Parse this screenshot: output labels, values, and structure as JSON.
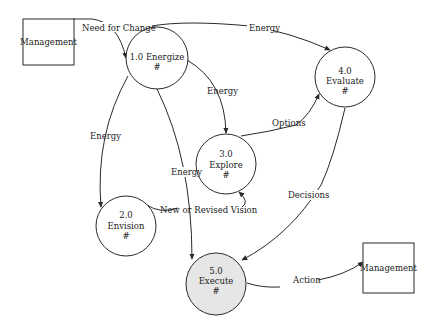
{
  "diagram": {
    "type": "data-flow-diagram",
    "colors": {
      "line": "#2a2a2a",
      "text": "#222222",
      "process_fill": "#ffffff",
      "execute_fill": "#e6e6e6",
      "background": "#ffffff"
    },
    "entities": [
      {
        "id": "mgmt_in",
        "label": "Management"
      },
      {
        "id": "mgmt_out",
        "label": "Management"
      }
    ],
    "processes": [
      {
        "id": "p1",
        "number": "1.0",
        "name": "Energize",
        "mark": "#"
      },
      {
        "id": "p2",
        "number": "2.0",
        "name": "Envision",
        "mark": "#"
      },
      {
        "id": "p3",
        "number": "3.0",
        "name": "Explore",
        "mark": "#"
      },
      {
        "id": "p4",
        "number": "4.0",
        "name": "Evaluate",
        "mark": "#"
      },
      {
        "id": "p5",
        "number": "5.0",
        "name": "Execute",
        "mark": "#"
      }
    ],
    "flows": [
      {
        "from": "Management",
        "to": "1.0 Energize",
        "label": "Need for Change"
      },
      {
        "from": "1.0 Energize",
        "to": "4.0 Evaluate",
        "label": "Energy"
      },
      {
        "from": "1.0 Energize",
        "to": "3.0 Explore",
        "label": "Energy"
      },
      {
        "from": "1.0 Energize",
        "to": "2.0 Envision",
        "label": "Energy"
      },
      {
        "from": "1.0 Energize",
        "to": "5.0 Execute",
        "label": "Energy"
      },
      {
        "from": "2.0 Envision",
        "to": "3.0 Explore",
        "label": "New or Revised Vision"
      },
      {
        "from": "3.0 Explore",
        "to": "4.0 Evaluate",
        "label": "Options"
      },
      {
        "from": "4.0 Evaluate",
        "to": "5.0 Execute",
        "label": "Decisions"
      },
      {
        "from": "5.0 Execute",
        "to": "Management",
        "label": "Action"
      }
    ],
    "energize_title": "1.0 Energize"
  }
}
